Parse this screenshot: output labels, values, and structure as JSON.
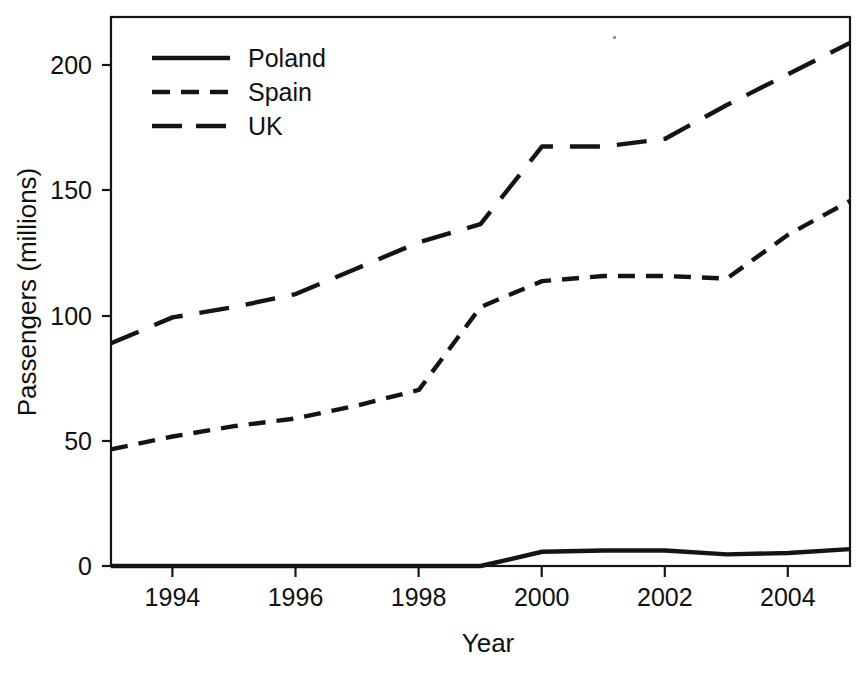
{
  "chart_data": {
    "type": "line",
    "title": "",
    "xlabel": "Year",
    "ylabel": "Passengers (millions)",
    "xlim": [
      1993,
      2005
    ],
    "ylim": [
      0,
      212
    ],
    "xticks": [
      1994,
      1996,
      1998,
      2000,
      2002,
      2004
    ],
    "yticks": [
      0,
      50,
      100,
      150,
      200
    ],
    "grid": false,
    "legend_position": "top-left",
    "x": [
      1993,
      1994,
      1995,
      1996,
      1997,
      1998,
      1999,
      2000,
      2001,
      2002,
      2003,
      2004,
      2005
    ],
    "series": [
      {
        "name": "Poland",
        "style": "solid",
        "values": [
          0,
          0,
          0,
          0,
          0,
          0,
          0,
          5.5,
          6,
          6,
          4.5,
          5,
          6.5
        ]
      },
      {
        "name": "Spain",
        "style": "dashed-short",
        "values": [
          45,
          50,
          54,
          57,
          62,
          68,
          100,
          110,
          112,
          112,
          111,
          128,
          141
        ]
      },
      {
        "name": "UK",
        "style": "dashed-long",
        "values": [
          86,
          96,
          100,
          105,
          115,
          125,
          132,
          162,
          162,
          165,
          178,
          190,
          202
        ]
      }
    ]
  },
  "axes": {
    "y_title": "Passengers (millions)",
    "x_title": "Year",
    "y_tick_labels": [
      "0",
      "50",
      "100",
      "150",
      "200"
    ],
    "x_tick_labels": [
      "1994",
      "1996",
      "1998",
      "2000",
      "2002",
      "2004"
    ]
  },
  "legend": {
    "entries": [
      {
        "label": "Poland",
        "style": "solid"
      },
      {
        "label": "Spain",
        "style": "dashed-short"
      },
      {
        "label": "UK",
        "style": "dashed-long"
      }
    ]
  },
  "colors": {
    "ink": "#141414",
    "background": "#ffffff"
  }
}
